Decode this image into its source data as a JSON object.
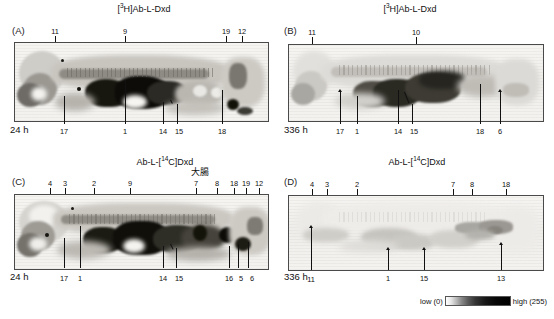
{
  "figure": {
    "panels": [
      {
        "id": "A",
        "letter": "(A)",
        "title_prefix": "[",
        "title_sup": "3",
        "title_suffix": "H]Ab-L-Dxd",
        "title_full": "[3H]Ab-L-Dxd",
        "timepoint": "24 h",
        "top_labels": [
          "11",
          "9",
          "19",
          "12"
        ],
        "bottom_labels": [
          "17",
          "1",
          "14",
          "15",
          "18"
        ]
      },
      {
        "id": "B",
        "letter": "(B)",
        "title_prefix": "[",
        "title_sup": "3",
        "title_suffix": "H]Ab-L-Dxd",
        "title_full": "[3H]Ab-L-Dxd",
        "timepoint": "336 h",
        "top_labels": [
          "11",
          "10"
        ],
        "bottom_labels": [
          "17",
          "1",
          "14",
          "15",
          "18",
          "6"
        ]
      },
      {
        "id": "C",
        "letter": "(C)",
        "title_prefix": "Ab-L-[",
        "title_sup": "14",
        "title_suffix": "C]Dxd",
        "title_full": "Ab-L-[14C]Dxd",
        "organ_annotation": "大腸",
        "timepoint": "24 h",
        "top_labels": [
          "4",
          "3",
          "2",
          "9",
          "7",
          "8",
          "18",
          "19",
          "12"
        ],
        "bottom_labels": [
          "17",
          "1",
          "14",
          "15",
          "16",
          "5",
          "6"
        ]
      },
      {
        "id": "D",
        "letter": "(D)",
        "title_prefix": "Ab-L-[",
        "title_sup": "14",
        "title_suffix": "C]Dxd",
        "title_full": "Ab-L-[14C]Dxd",
        "timepoint": "336 h",
        "top_labels": [
          "4",
          "3",
          "2",
          "7",
          "8",
          "18"
        ],
        "bottom_labels": [
          "11",
          "1",
          "15",
          "13"
        ]
      }
    ],
    "intensity_scale": {
      "low_label": "low (0)",
      "high_label": "high (255)",
      "low_value": 0,
      "high_value": 255
    },
    "colors": {
      "text": "#111111",
      "frame_border": "#4a4a4a",
      "film_background": "#f2f1ee",
      "leader_line": "#111111"
    }
  }
}
